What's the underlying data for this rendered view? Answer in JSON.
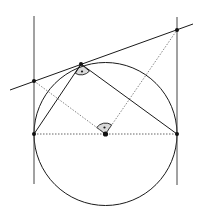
{
  "diagram": {
    "type": "geometry",
    "colors": {
      "stroke": "#1a1a1a",
      "dotted": "#555555",
      "angle_fill": "#d9d9d9",
      "background": "#ffffff"
    },
    "circle": {
      "cx": 105.5,
      "cy": 134,
      "r": 71.5
    },
    "points": {
      "A": {
        "x": 34,
        "y": 134
      },
      "B": {
        "x": 177,
        "y": 134
      },
      "M": {
        "x": 105.5,
        "y": 134
      },
      "T": {
        "x": 81,
        "y": 64
      },
      "P": {
        "x": 34,
        "y": 81
      },
      "Q": {
        "x": 177,
        "y": 30
      }
    },
    "lines": {
      "left_tangent": {
        "x1": 34,
        "y1": 16,
        "x2": 34,
        "y2": 184
      },
      "right_tangent": {
        "x1": 177,
        "y1": 17,
        "x2": 177,
        "y2": 185
      },
      "top_tangent": {
        "x1": 10,
        "y1": 90,
        "x2": 193,
        "y2": 24
      }
    },
    "segments_solid": [
      {
        "from": "A",
        "to": "T"
      },
      {
        "from": "T",
        "to": "B"
      }
    ],
    "segments_dotted": [
      {
        "from": "A",
        "to": "B"
      },
      {
        "from": "P",
        "to": "M"
      },
      {
        "from": "M",
        "to": "Q"
      }
    ],
    "right_angle_marks": [
      {
        "vertex": "T",
        "label": "angle ATB"
      },
      {
        "vertex": "M",
        "label": "angle PMQ"
      }
    ]
  }
}
